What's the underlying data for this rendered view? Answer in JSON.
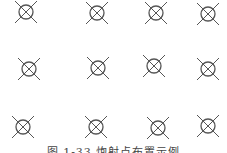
{
  "diagram": {
    "symbol": "circle-cross-icon",
    "stroke_color": "#555555",
    "points": [
      {
        "x": 26,
        "y": 12
      },
      {
        "x": 97,
        "y": 13
      },
      {
        "x": 156,
        "y": 13
      },
      {
        "x": 208,
        "y": 14
      },
      {
        "x": 29,
        "y": 69
      },
      {
        "x": 98,
        "y": 68
      },
      {
        "x": 154,
        "y": 66
      },
      {
        "x": 208,
        "y": 69
      },
      {
        "x": 23,
        "y": 127
      },
      {
        "x": 96,
        "y": 127
      },
      {
        "x": 158,
        "y": 128
      },
      {
        "x": 208,
        "y": 126
      }
    ]
  },
  "caption": "图 1-33  炮射点布置示例"
}
